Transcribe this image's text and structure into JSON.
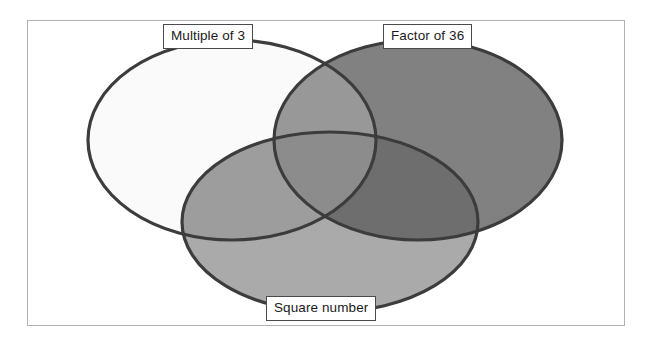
{
  "figure": {
    "type": "venn-diagram",
    "set_count": 3,
    "frame_border_color": "#b2b2b2",
    "background_color": "#ffffff",
    "outline_color": "#3c3c3c"
  },
  "labels": {
    "left": "Multiple of 3",
    "right": "Factor of 36",
    "bottom": "Square number"
  },
  "sets": [
    {
      "id": "multiple-of-3",
      "name": "Multiple of 3",
      "position": "left",
      "fill": "#fafafa",
      "cx": 232,
      "cy": 140,
      "rx": 144,
      "ry": 100
    },
    {
      "id": "factor-of-36",
      "name": "Factor of 36",
      "position": "right",
      "fill": "#818181",
      "cx": 418,
      "cy": 140,
      "rx": 144,
      "ry": 100
    },
    {
      "id": "square-number",
      "name": "Square number",
      "position": "bottom",
      "fill": "#aaaaaa",
      "cx": 330,
      "cy": 222,
      "rx": 148,
      "ry": 90
    }
  ],
  "regions": [
    {
      "id": "left-only",
      "sets": [
        "Multiple of 3"
      ],
      "fill": "#fafafa"
    },
    {
      "id": "right-only",
      "sets": [
        "Factor of 36"
      ],
      "fill": "#818181"
    },
    {
      "id": "bottom-only",
      "sets": [
        "Square number"
      ],
      "fill": "#aaaaaa"
    },
    {
      "id": "left-right",
      "sets": [
        "Multiple of 3",
        "Factor of 36"
      ],
      "fill": "#989898"
    },
    {
      "id": "left-bottom",
      "sets": [
        "Multiple of 3",
        "Square number"
      ],
      "fill": "#9d9d9d"
    },
    {
      "id": "right-bottom",
      "sets": [
        "Factor of 36",
        "Square number"
      ],
      "fill": "#6e6e6e"
    },
    {
      "id": "all-three",
      "sets": [
        "Multiple of 3",
        "Factor of 36",
        "Square number"
      ],
      "fill": "#8c8c8c"
    }
  ],
  "chart_data": {
    "type": "venn",
    "title": "",
    "sets": [
      "Multiple of 3",
      "Factor of 36",
      "Square number"
    ],
    "region_labels": [],
    "region_values": [],
    "legend": "none",
    "grid": false
  }
}
